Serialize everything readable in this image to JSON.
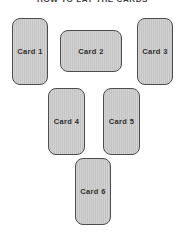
{
  "title": "HOW TO LAY THE CARDS",
  "cards": [
    {
      "label": "Card 1",
      "orientation": "vertical"
    },
    {
      "label": "Card 2",
      "orientation": "horizontal"
    },
    {
      "label": "Card 3",
      "orientation": "vertical"
    },
    {
      "label": "Card 4",
      "orientation": "vertical"
    },
    {
      "label": "Card 5",
      "orientation": "vertical"
    },
    {
      "label": "Card 6",
      "orientation": "vertical"
    }
  ],
  "layout": {
    "rows": [
      [
        "Card 1",
        "Card 2",
        "Card 3"
      ],
      [
        "Card 4",
        "Card 5"
      ],
      [
        "Card 6"
      ]
    ]
  },
  "colors": {
    "background": "#ffffff",
    "card_fill": "#c9c9c9",
    "card_border": "#4d4d4d",
    "label_text": "#2e2e2e",
    "title_text": "#3a3a3a"
  }
}
